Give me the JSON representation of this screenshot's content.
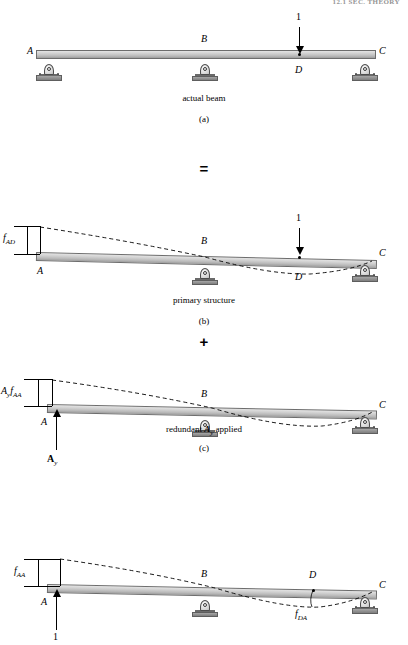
{
  "figure": {
    "header": "12.1  SEC.   THEORY",
    "operator_equals": "=",
    "operator_plus": "+"
  },
  "panels": [
    {
      "id": "a",
      "caption": "actual beam",
      "letter": "(a)",
      "supports": [
        {
          "label": "A",
          "type": "pin"
        },
        {
          "label": "B",
          "type": "rocker"
        },
        {
          "label": "C",
          "type": "pin"
        }
      ],
      "load": {
        "value": "1",
        "direction": "down",
        "at": "D"
      },
      "point_label": "D"
    },
    {
      "id": "b",
      "caption": "primary structure",
      "letter": "(b)",
      "supports": [
        {
          "label": "A",
          "type": "free"
        },
        {
          "label": "B",
          "type": "rocker"
        },
        {
          "label": "C",
          "type": "pin"
        }
      ],
      "load": {
        "value": "1",
        "direction": "down",
        "at": "D"
      },
      "point_label": "D",
      "dimension": {
        "symbol": "f",
        "subscript": "AD"
      }
    },
    {
      "id": "c",
      "caption": "redundant A_y applied",
      "caption_prefix": "redundant ",
      "caption_bold": "A",
      "caption_sub": "y",
      "caption_suffix": " applied",
      "letter": "(c)",
      "supports": [
        {
          "label": "A",
          "type": "free"
        },
        {
          "label": "B",
          "type": "rocker"
        },
        {
          "label": "C",
          "type": "pin"
        }
      ],
      "reaction": {
        "symbol": "A",
        "subscript": "y",
        "direction": "up"
      },
      "dimension": {
        "prefix": "A",
        "prefix_sub": "y",
        "symbol": "f",
        "subscript": "AA"
      }
    },
    {
      "id": "d",
      "caption": "",
      "letter": "",
      "supports": [
        {
          "label": "A",
          "type": "free"
        },
        {
          "label": "B",
          "type": "rocker"
        },
        {
          "label": "C",
          "type": "pin"
        }
      ],
      "load": {
        "value": "1",
        "direction": "up",
        "at": "A"
      },
      "point_label": "D",
      "dimension": {
        "symbol": "f",
        "subscript": "AA"
      },
      "deflection_label": {
        "symbol": "f",
        "subscript": "DA"
      }
    }
  ],
  "labels": {
    "A": "A",
    "B": "B",
    "C": "C",
    "D": "D",
    "one": "1",
    "f": "f",
    "sub_AD": "AD",
    "sub_AA": "AA",
    "sub_DA": "DA",
    "sub_y": "y",
    "Ay_A": "A",
    "cap_a": "actual beam",
    "cap_b": "primary structure",
    "cap_c_pre": "redundant ",
    "cap_c_bold": "A",
    "cap_c_sub": "y",
    "cap_c_post": " applied",
    "let_a": "(a)",
    "let_b": "(b)",
    "let_c": "(c)"
  },
  "colors": {
    "beam_top": "#e4e4e4",
    "beam_bottom": "#9d9d9d",
    "outline": "#6d6d6d",
    "plate": "#8e8e8e",
    "ink": "#000000"
  }
}
